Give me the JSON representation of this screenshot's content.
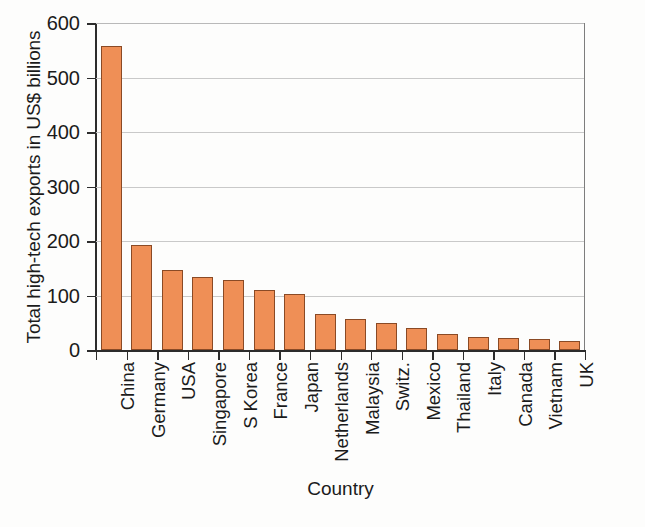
{
  "chart_data": {
    "type": "bar",
    "title": "",
    "xlabel": "Country",
    "ylabel": "Total high-tech exports in US$ billions",
    "ylim": [
      0,
      600
    ],
    "ytick_values": [
      0,
      100,
      200,
      300,
      400,
      500,
      600
    ],
    "ytick_labels": [
      "0",
      "100",
      "200",
      "300",
      "400",
      "500",
      "600"
    ],
    "grid": true,
    "legend": "none",
    "bar_color": "#ef8f56",
    "bar_edge_color": "#8a4a25",
    "categories": [
      "China",
      "Germany",
      "USA",
      "Singapore",
      "S Korea",
      "France",
      "Japan",
      "Netherlands",
      "Malaysia",
      "Switz.",
      "Mexico",
      "Thailand",
      "Italy",
      "Canada",
      "Vietnam",
      "UK"
    ],
    "values": [
      558,
      192,
      146,
      134,
      129,
      111,
      103,
      66,
      57,
      49,
      41,
      29,
      23,
      22,
      21,
      17
    ]
  },
  "axes": {
    "x_title": "Country",
    "y_title": "Total high-tech exports in US$ billions"
  },
  "artifact": {
    "text": ""
  }
}
